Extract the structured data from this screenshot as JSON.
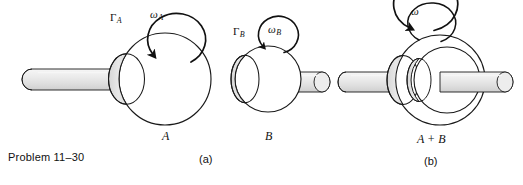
{
  "figure": {
    "caption": "Problem 11–30",
    "panels": [
      {
        "id": "a",
        "subcaption": "(a)",
        "bodies": [
          {
            "name": "A",
            "part_label": "A",
            "torque_symbol": "Γ",
            "torque_subscript": "A",
            "omega_symbol": "ω",
            "omega_subscript": "A",
            "rotation_direction": "clockwise",
            "shaft_side": "left"
          },
          {
            "name": "B",
            "part_label": "B",
            "torque_symbol": "Γ",
            "torque_subscript": "B",
            "omega_symbol": "ω",
            "omega_subscript": "B",
            "rotation_direction": "clockwise",
            "shaft_side": "right"
          }
        ]
      },
      {
        "id": "b",
        "subcaption": "(b)",
        "bodies": [
          {
            "name": "A + B",
            "part_label": "A + B",
            "torque_symbol": "",
            "torque_subscript": "",
            "omega_symbol": "ω",
            "omega_subscript": "",
            "rotation_direction": "clockwise",
            "shaft_side": "both"
          }
        ]
      }
    ]
  },
  "colors": {
    "ink": "#111111",
    "outline": "#1a1a1a",
    "disk_face": "#ffffff",
    "disk_rim": "#e2e2e2",
    "disk_rim_dark": "#d2d2d2",
    "shaft_fill": "#e6e6e6",
    "shaft_highlight": "#f4f4f4",
    "background": "#ffffff"
  }
}
